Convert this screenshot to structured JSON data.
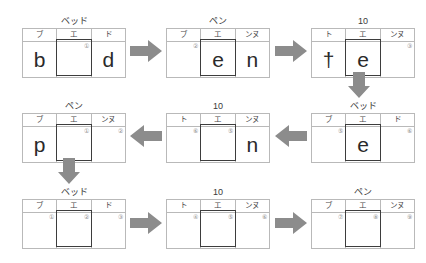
{
  "diagram": {
    "arrow_color": "#8c8c8c",
    "focus_border_color": "#3d3d3d",
    "grid_line_color": "#b9b9b9",
    "step_count": 9
  },
  "steps": [
    {
      "id": "step-1",
      "position": "top-left",
      "header": "ベッド",
      "columns": [
        "ブ",
        "エ",
        "ド"
      ],
      "cells": [
        {
          "glyph": "b",
          "marker": ""
        },
        {
          "glyph": "",
          "marker": "①"
        },
        {
          "glyph": "d",
          "marker": ""
        }
      ]
    },
    {
      "id": "step-2",
      "position": "top-center",
      "header": "ペン",
      "columns": [
        "ブ",
        "エ",
        "ンヌ"
      ],
      "cells": [
        {
          "glyph": "",
          "marker": "②"
        },
        {
          "glyph": "e",
          "marker": ""
        },
        {
          "glyph": "n",
          "marker": ""
        }
      ]
    },
    {
      "id": "step-3",
      "position": "top-right",
      "header": "10",
      "columns": [
        "ト",
        "エ",
        "ンヌ"
      ],
      "cells": [
        {
          "glyph": "†",
          "marker": ""
        },
        {
          "glyph": "e",
          "marker": ""
        },
        {
          "glyph": "",
          "marker": "③"
        }
      ]
    },
    {
      "id": "step-4",
      "position": "middle-right",
      "header": "ベッド",
      "columns": [
        "ブ",
        "エ",
        "ド"
      ],
      "cells": [
        {
          "glyph": "",
          "marker": "⑤"
        },
        {
          "glyph": "e",
          "marker": ""
        },
        {
          "glyph": "",
          "marker": "⑥"
        }
      ]
    },
    {
      "id": "step-5",
      "position": "middle-center",
      "header": "10",
      "columns": [
        "ト",
        "エ",
        "ンヌ"
      ],
      "cells": [
        {
          "glyph": "",
          "marker": "⑥"
        },
        {
          "glyph": "",
          "marker": "⑤"
        },
        {
          "glyph": "n",
          "marker": ""
        }
      ]
    },
    {
      "id": "step-6",
      "position": "middle-left",
      "header": "ペン",
      "columns": [
        "ブ",
        "エ",
        "ンヌ"
      ],
      "cells": [
        {
          "glyph": "p",
          "marker": ""
        },
        {
          "glyph": "",
          "marker": "①"
        },
        {
          "glyph": "",
          "marker": "②"
        }
      ]
    },
    {
      "id": "step-7",
      "position": "bottom-left",
      "header": "ベッド",
      "columns": [
        "ブ",
        "エ",
        "ド"
      ],
      "cells": [
        {
          "glyph": "",
          "marker": "①"
        },
        {
          "glyph": "",
          "marker": "②"
        },
        {
          "glyph": "",
          "marker": "③"
        }
      ]
    },
    {
      "id": "step-8",
      "position": "bottom-center",
      "header": "10",
      "columns": [
        "ト",
        "エ",
        "ンヌ"
      ],
      "cells": [
        {
          "glyph": "",
          "marker": "④"
        },
        {
          "glyph": "",
          "marker": "⑤"
        },
        {
          "glyph": "",
          "marker": "⑥"
        }
      ]
    },
    {
      "id": "step-9",
      "position": "bottom-right",
      "header": "ペン",
      "columns": [
        "ブ",
        "エ",
        "ンヌ"
      ],
      "cells": [
        {
          "glyph": "",
          "marker": "⑦"
        },
        {
          "glyph": "",
          "marker": "⑧"
        },
        {
          "glyph": "",
          "marker": "⑨"
        }
      ]
    }
  ],
  "arrows": [
    {
      "id": "arrow-1",
      "direction": "right",
      "from": "step-1",
      "to": "step-2"
    },
    {
      "id": "arrow-2",
      "direction": "right",
      "from": "step-2",
      "to": "step-3"
    },
    {
      "id": "arrow-3",
      "direction": "down",
      "from": "step-3",
      "to": "step-4"
    },
    {
      "id": "arrow-4",
      "direction": "left",
      "from": "step-4",
      "to": "step-5"
    },
    {
      "id": "arrow-5",
      "direction": "left",
      "from": "step-5",
      "to": "step-6"
    },
    {
      "id": "arrow-6",
      "direction": "down",
      "from": "step-6",
      "to": "step-7"
    },
    {
      "id": "arrow-7",
      "direction": "right",
      "from": "step-7",
      "to": "step-8"
    },
    {
      "id": "arrow-8",
      "direction": "right",
      "from": "step-8",
      "to": "step-9"
    }
  ]
}
